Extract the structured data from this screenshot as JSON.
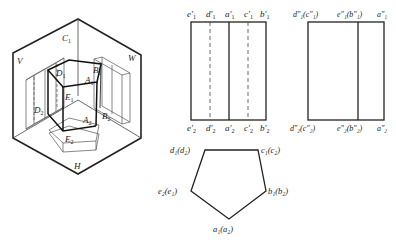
{
  "iso_view": {
    "planes": {
      "V": "V",
      "W": "W",
      "H": "H"
    },
    "top_points": {
      "A": "A",
      "B": "B",
      "C": "C",
      "D": "D",
      "E": "E",
      "sub": "1"
    },
    "bottom_points": {
      "A": "A",
      "B": "B",
      "D": "D",
      "E": "E",
      "sub": "2"
    }
  },
  "front_view": {
    "top_labels": [
      "e",
      "d",
      "a",
      "c",
      "b"
    ],
    "top_sub": "1",
    "bottom_labels": [
      "e",
      "d",
      "a",
      "c",
      "b"
    ],
    "bottom_sub": "2",
    "prime": "′"
  },
  "side_view": {
    "top_labels": [
      "d″₁(c″₁)",
      "e″₁(b″₁)",
      "a″₁"
    ],
    "bottom_labels": [
      "d″₂(c″₂)",
      "e″₂(b″₂)",
      "a″₂"
    ]
  },
  "top_view": {
    "labels": {
      "dd": "d₁(d₂)",
      "cc": "c₁(c₂)",
      "ee": "e₂(e₁)",
      "bb": "b₁(b₂)",
      "aa": "a₁(a₂)"
    }
  },
  "colors": {
    "line": "#222222",
    "thin": "#555555"
  }
}
